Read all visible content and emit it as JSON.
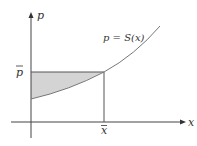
{
  "diagram": {
    "axes": {
      "x_label": "x",
      "y_label": "p"
    },
    "curve_label": "p = S(x)",
    "price_label": "p̄",
    "quantity_label": "x̄",
    "colors": {
      "axis": "#444444",
      "curve": "#666666",
      "shade": "#d4d4d4"
    }
  }
}
